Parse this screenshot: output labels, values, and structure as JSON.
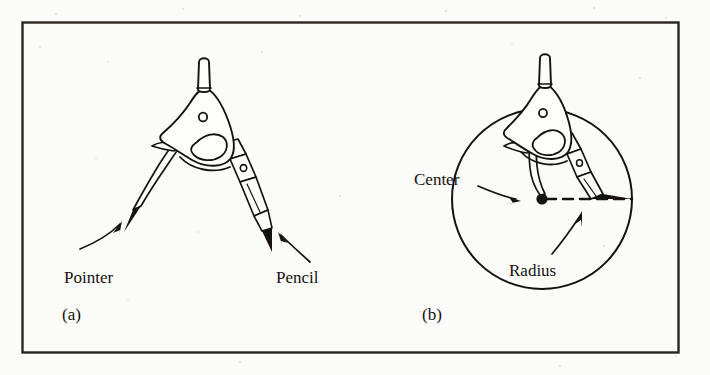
{
  "figure": {
    "background_color": "#fbfbf9",
    "ink_color": "#15120f",
    "frame_color": "#2a2622"
  },
  "panels": [
    {
      "id": "a",
      "label": "(a)",
      "callouts": [
        {
          "name": "pointer",
          "text": "Pointer"
        },
        {
          "name": "pencil",
          "text": "Pencil"
        }
      ]
    },
    {
      "id": "b",
      "label": "(b)",
      "callouts": [
        {
          "name": "center",
          "text": "Center"
        },
        {
          "name": "radius",
          "text": "Radius"
        }
      ]
    }
  ],
  "labels": {
    "pointer": "Pointer",
    "pencil": "Pencil",
    "center": "Center",
    "radius": "Radius",
    "panel_a": "(a)",
    "panel_b": "(b)"
  }
}
